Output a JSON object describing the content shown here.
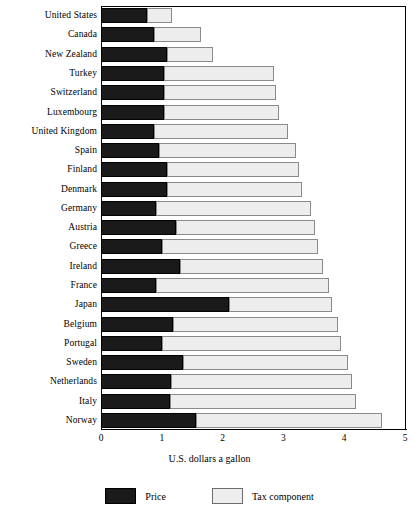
{
  "chart": {
    "axis_title": "U.S. dollars a gallon",
    "tick_labels": [
      "0",
      "1",
      "2",
      "3",
      "4",
      "5"
    ],
    "legend": [
      {
        "key": "price",
        "label": "Price",
        "color": "#1a1a1a"
      },
      {
        "key": "tax",
        "label": "Tax component",
        "color": "#ededed"
      }
    ]
  },
  "chart_data": {
    "type": "bar",
    "orientation": "horizontal",
    "stacked": true,
    "title": "",
    "subtitle": "",
    "xlabel": "U.S. dollars a gallon",
    "ylabel": "",
    "xlim": [
      0,
      5
    ],
    "xticks": [
      0,
      1,
      2,
      3,
      4,
      5
    ],
    "grid": false,
    "legend_position": "bottom",
    "categories": [
      "United States",
      "Canada",
      "New Zealand",
      "Turkey",
      "Switzerland",
      "Luxembourg",
      "United Kingdom",
      "Spain",
      "Finland",
      "Denmark",
      "Germany",
      "Austria",
      "Greece",
      "Ireland",
      "France",
      "Japan",
      "Belgium",
      "Portugal",
      "Sweden",
      "Netherlands",
      "Italy",
      "Norway"
    ],
    "series": [
      {
        "name": "Price",
        "color": "#1a1a1a",
        "values": [
          0.75,
          0.87,
          1.08,
          1.03,
          1.03,
          1.03,
          0.87,
          0.95,
          1.08,
          1.08,
          0.9,
          1.24,
          1.0,
          1.3,
          0.9,
          2.1,
          1.18,
          1.0,
          1.35,
          1.15,
          1.13,
          1.56
        ]
      },
      {
        "name": "Tax component",
        "color": "#ededed",
        "values": [
          0.42,
          0.78,
          0.77,
          1.82,
          1.85,
          1.9,
          2.2,
          2.25,
          2.17,
          2.22,
          2.55,
          2.28,
          2.57,
          2.35,
          2.85,
          1.7,
          2.72,
          2.95,
          2.72,
          2.98,
          3.07,
          3.06
        ]
      }
    ],
    "totals": [
      1.17,
      1.65,
      1.85,
      2.85,
      2.88,
      2.93,
      3.07,
      3.2,
      3.25,
      3.3,
      3.45,
      3.52,
      3.57,
      3.65,
      3.75,
      3.8,
      3.9,
      3.95,
      4.07,
      4.13,
      4.2,
      4.62
    ]
  }
}
